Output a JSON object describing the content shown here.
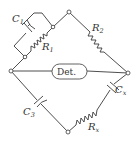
{
  "diagram": {
    "type": "ac bridge circuit",
    "detector": {
      "label": "Det."
    },
    "components": [
      {
        "id": "C1",
        "kind": "capacitor",
        "label": "C",
        "sub": "1"
      },
      {
        "id": "R1",
        "kind": "resistor",
        "label": "R",
        "sub": "1"
      },
      {
        "id": "R2",
        "kind": "resistor",
        "label": "R",
        "sub": "2"
      },
      {
        "id": "C3",
        "kind": "capacitor",
        "label": "C",
        "sub": "3"
      },
      {
        "id": "Cx",
        "kind": "capacitor",
        "label": "C",
        "sub": "x"
      },
      {
        "id": "Rx",
        "kind": "resistor",
        "label": "R",
        "sub": "x"
      }
    ],
    "colors": {
      "line": "#3a3a3a",
      "background": "#ffffff"
    }
  }
}
